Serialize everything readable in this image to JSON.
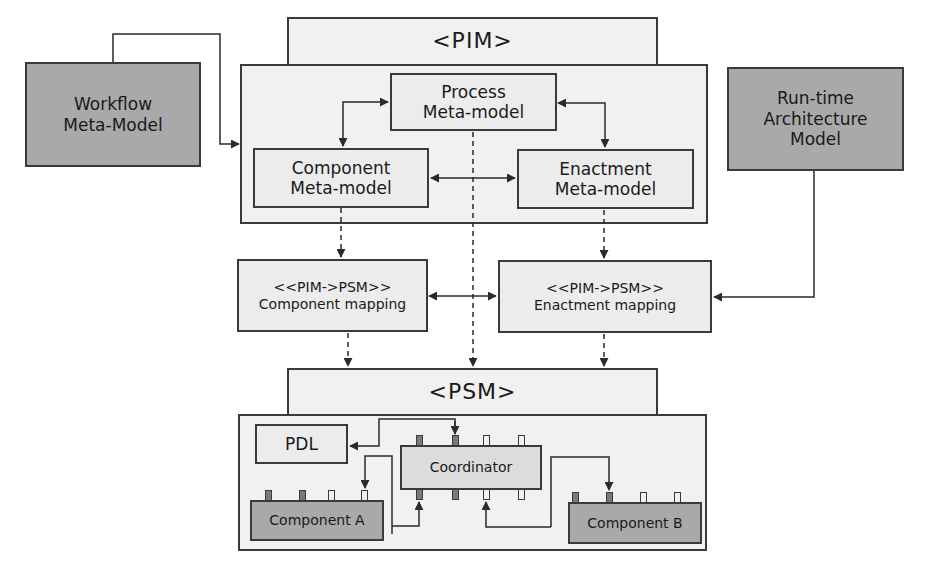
{
  "pim": {
    "title": "<PIM>",
    "process": [
      "Process",
      "Meta-model"
    ],
    "component": [
      "Component",
      "Meta-model"
    ],
    "enactment": [
      "Enactment",
      "Meta-model"
    ]
  },
  "external": {
    "workflow": [
      "Workflow",
      "Meta-Model"
    ],
    "runtime": [
      "Run-time",
      "Architecture",
      "Model"
    ]
  },
  "mappings": {
    "component": [
      "<<PIM->PSM>>",
      "Component mapping"
    ],
    "enactment": [
      "<<PIM->PSM>>",
      "Enactment mapping"
    ]
  },
  "psm": {
    "title": "<PSM>",
    "pdl": "PDL",
    "coordinator": "Coordinator",
    "component_a": "Component A",
    "component_b": "Component B"
  },
  "colors": {
    "line": "#3a3a3a",
    "external_fill": "#a9a9a9",
    "frame_fill": "#f1f1f1",
    "box_fill": "#e4e4e4"
  }
}
